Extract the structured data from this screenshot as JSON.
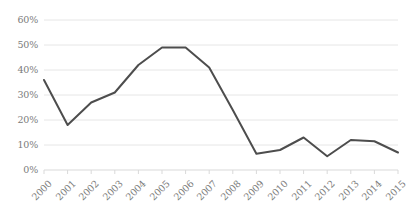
{
  "chart_data": {
    "type": "line",
    "title": "",
    "xlabel": "",
    "ylabel": "",
    "categories": [
      "2000",
      "2001",
      "2002",
      "2003",
      "2004",
      "2005",
      "2006",
      "2007",
      "2008",
      "2009",
      "2010",
      "2011",
      "2012",
      "2013",
      "2014",
      "2015"
    ],
    "values": [
      36,
      18,
      27,
      31,
      42,
      49,
      49,
      41,
      24,
      6.5,
      8,
      13,
      5.5,
      12,
      11.5,
      7
    ],
    "series": [
      {
        "name": "",
        "values": [
          36,
          18,
          27,
          31,
          42,
          49,
          49,
          41,
          24,
          6.5,
          8,
          13,
          5.5,
          12,
          11.5,
          7
        ]
      }
    ],
    "ylim": [
      0,
      60
    ],
    "ytick_values": [
      0,
      10,
      20,
      30,
      40,
      50,
      60
    ],
    "ytick_labels": [
      "0%",
      "10%",
      "20%",
      "30%",
      "40%",
      "50%",
      "60%"
    ],
    "xtick_labels": [
      "2000",
      "2001",
      "2002",
      "2003",
      "2004",
      "2005",
      "2006",
      "2007",
      "2008",
      "2009",
      "2010",
      "2011",
      "2012",
      "2013",
      "2014",
      "2015"
    ],
    "grid": true,
    "grid_axis": "y",
    "legend": false,
    "legend_position": "none",
    "markers": false,
    "colors": {
      "line": "#4d4d4d",
      "grid": "#e6e6e6",
      "axis": "#d9d9d9",
      "tick_text": "#7b7b7b",
      "background": "#ffffff"
    },
    "line_width_px": 2,
    "xtick_rotation_deg": -45
  }
}
